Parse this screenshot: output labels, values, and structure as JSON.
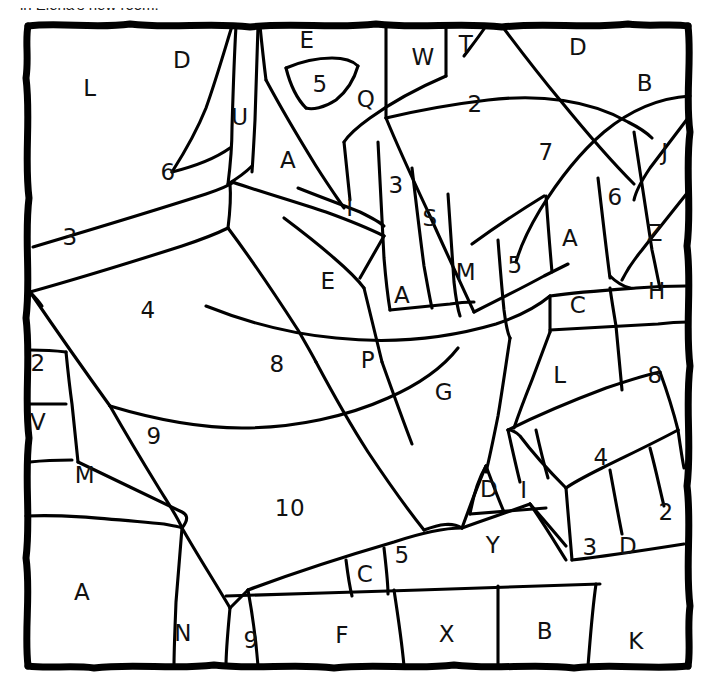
{
  "caption": {
    "text": "in Elena's new room."
  },
  "canvas": {
    "width": 710,
    "height": 691,
    "background": "#ffffff",
    "ink": "#000000"
  },
  "border": {
    "style": "hand-drawn-wobbly-rectangle",
    "x": 26,
    "y": 22,
    "width": 664,
    "height": 646,
    "stroke_width": 7
  },
  "puzzle": {
    "kind": "color-by-symbol-mosaic",
    "cell_count": 59,
    "cells": [
      {
        "id": "c01",
        "label": "L",
        "x": 90,
        "y": 88
      },
      {
        "id": "c02",
        "label": "D",
        "x": 182,
        "y": 60
      },
      {
        "id": "c03",
        "label": "U",
        "x": 240,
        "y": 117
      },
      {
        "id": "c04",
        "label": "E",
        "x": 307,
        "y": 40
      },
      {
        "id": "c05",
        "label": "5",
        "x": 320,
        "y": 84
      },
      {
        "id": "c06",
        "label": "Q",
        "x": 366,
        "y": 99
      },
      {
        "id": "c07",
        "label": "W",
        "x": 423,
        "y": 57
      },
      {
        "id": "c08",
        "label": "T",
        "x": 466,
        "y": 44
      },
      {
        "id": "c09",
        "label": "D",
        "x": 578,
        "y": 47
      },
      {
        "id": "c10",
        "label": "B",
        "x": 645,
        "y": 83
      },
      {
        "id": "c11",
        "label": "2",
        "x": 475,
        "y": 104
      },
      {
        "id": "c12",
        "label": "7",
        "x": 546,
        "y": 152
      },
      {
        "id": "c13",
        "label": "J",
        "x": 665,
        "y": 152
      },
      {
        "id": "c14",
        "label": "6",
        "x": 168,
        "y": 172
      },
      {
        "id": "c15",
        "label": "A",
        "x": 288,
        "y": 160
      },
      {
        "id": "c16",
        "label": "3",
        "x": 396,
        "y": 185
      },
      {
        "id": "c17",
        "label": "6",
        "x": 615,
        "y": 197
      },
      {
        "id": "c18",
        "label": "I",
        "x": 350,
        "y": 208
      },
      {
        "id": "c19",
        "label": "S",
        "x": 430,
        "y": 218
      },
      {
        "id": "c20",
        "label": "Z",
        "x": 655,
        "y": 233
      },
      {
        "id": "c21",
        "label": "3",
        "x": 70,
        "y": 237
      },
      {
        "id": "c22",
        "label": "A",
        "x": 570,
        "y": 238
      },
      {
        "id": "c23",
        "label": "E",
        "x": 328,
        "y": 281
      },
      {
        "id": "c24",
        "label": "M",
        "x": 466,
        "y": 272
      },
      {
        "id": "c25",
        "label": "5",
        "x": 515,
        "y": 265
      },
      {
        "id": "c26",
        "label": "A",
        "x": 402,
        "y": 295
      },
      {
        "id": "c27",
        "label": "C",
        "x": 578,
        "y": 305
      },
      {
        "id": "c28",
        "label": "H",
        "x": 657,
        "y": 291
      },
      {
        "id": "c29",
        "label": "4",
        "x": 148,
        "y": 310
      },
      {
        "id": "c30",
        "label": "2",
        "x": 38,
        "y": 363
      },
      {
        "id": "c31",
        "label": "8",
        "x": 277,
        "y": 364
      },
      {
        "id": "c32",
        "label": "P",
        "x": 368,
        "y": 360
      },
      {
        "id": "c33",
        "label": "L",
        "x": 560,
        "y": 375
      },
      {
        "id": "c34",
        "label": "8",
        "x": 655,
        "y": 375
      },
      {
        "id": "c35",
        "label": "G",
        "x": 444,
        "y": 392
      },
      {
        "id": "c36",
        "label": "V",
        "x": 38,
        "y": 422
      },
      {
        "id": "c37",
        "label": "9",
        "x": 154,
        "y": 436
      },
      {
        "id": "c38",
        "label": "4",
        "x": 601,
        "y": 457
      },
      {
        "id": "c39",
        "label": "M",
        "x": 85,
        "y": 475
      },
      {
        "id": "c40",
        "label": "D",
        "x": 489,
        "y": 489
      },
      {
        "id": "c41",
        "label": "I",
        "x": 524,
        "y": 490
      },
      {
        "id": "c42",
        "label": "10",
        "x": 290,
        "y": 508
      },
      {
        "id": "c43",
        "label": "2",
        "x": 666,
        "y": 512
      },
      {
        "id": "c44",
        "label": "Y",
        "x": 493,
        "y": 545
      },
      {
        "id": "c45",
        "label": "3",
        "x": 590,
        "y": 547
      },
      {
        "id": "c46",
        "label": "D",
        "x": 628,
        "y": 546
      },
      {
        "id": "c47",
        "label": "5",
        "x": 402,
        "y": 555
      },
      {
        "id": "c48",
        "label": "C",
        "x": 365,
        "y": 574
      },
      {
        "id": "c49",
        "label": "A",
        "x": 82,
        "y": 592
      },
      {
        "id": "c50",
        "label": "N",
        "x": 183,
        "y": 633
      },
      {
        "id": "c51",
        "label": "9",
        "x": 251,
        "y": 640
      },
      {
        "id": "c52",
        "label": "F",
        "x": 342,
        "y": 635
      },
      {
        "id": "c53",
        "label": "X",
        "x": 447,
        "y": 634
      },
      {
        "id": "c54",
        "label": "B",
        "x": 545,
        "y": 631
      },
      {
        "id": "c55",
        "label": "K",
        "x": 636,
        "y": 641
      }
    ]
  }
}
